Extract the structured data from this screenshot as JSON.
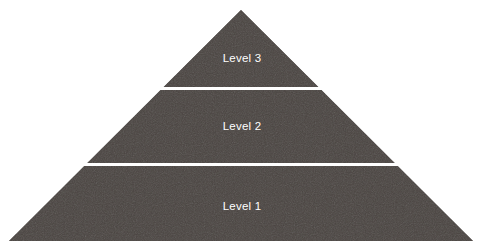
{
  "diagram": {
    "type": "pyramid",
    "title": "",
    "background_color": "#ffffff",
    "fill_color": "#4a4441",
    "divider_color": "#ffffff",
    "label_color": "#ffffff",
    "geometry": {
      "apex": [
        241,
        10
      ],
      "bottom_left": [
        9,
        241
      ],
      "bottom_right": [
        473,
        241
      ],
      "divider_y": [
        88.5,
        164.5
      ],
      "divider_thickness": 3
    },
    "levels": [
      {
        "label": "Level 3",
        "order": 3,
        "position": "top",
        "label_center": [
          241,
          57
        ]
      },
      {
        "label": "Level 2",
        "order": 2,
        "position": "middle",
        "label_center": [
          241,
          126
        ]
      },
      {
        "label": "Level 1",
        "order": 1,
        "position": "bottom",
        "label_center": [
          241,
          206
        ]
      }
    ]
  }
}
